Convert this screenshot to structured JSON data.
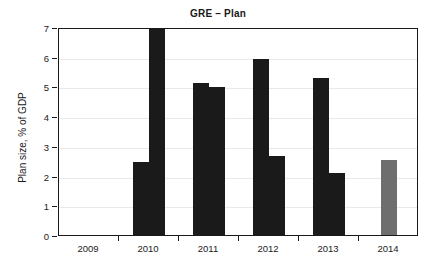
{
  "chart_data": {
    "type": "bar",
    "title": "GRE – Plan",
    "xlabel": "",
    "ylabel": "Plan size, % of GDP",
    "categories": [
      "2009",
      "2010",
      "2011",
      "2012",
      "2013",
      "2014"
    ],
    "ylim": [
      0,
      7
    ],
    "ytick_labels": [
      "0",
      "1",
      "2",
      "3",
      "4",
      "5",
      "6",
      "7"
    ],
    "ytick_values": [
      0,
      1,
      2,
      3,
      4,
      5,
      6,
      7
    ],
    "grid": true,
    "legend": "none",
    "series": [
      {
        "name": "first",
        "color": "#1a1a1a",
        "values": [
          null,
          2.45,
          5.1,
          5.93,
          5.3,
          null
        ]
      },
      {
        "name": "second",
        "color": "#1a1a1a",
        "values": [
          null,
          7.6,
          4.98,
          2.65,
          2.1,
          null
        ]
      },
      {
        "name": "projected",
        "color": "#6e6e6e",
        "values": [
          null,
          null,
          null,
          null,
          null,
          2.53
        ]
      }
    ],
    "bars": [
      {
        "category": "2010",
        "slot": 0,
        "value": 2.45,
        "color": "#1a1a1a",
        "clipped": false
      },
      {
        "category": "2010",
        "slot": 1,
        "value": 7.6,
        "color": "#1a1a1a",
        "clipped": true
      },
      {
        "category": "2011",
        "slot": 0,
        "value": 5.1,
        "color": "#1a1a1a",
        "clipped": false
      },
      {
        "category": "2011",
        "slot": 1,
        "value": 4.98,
        "color": "#1a1a1a",
        "clipped": false
      },
      {
        "category": "2012",
        "slot": 0,
        "value": 5.93,
        "color": "#1a1a1a",
        "clipped": false
      },
      {
        "category": "2012",
        "slot": 1,
        "value": 2.65,
        "color": "#1a1a1a",
        "clipped": false
      },
      {
        "category": "2013",
        "slot": 0,
        "value": 5.3,
        "color": "#1a1a1a",
        "clipped": false
      },
      {
        "category": "2013",
        "slot": 1,
        "value": 2.1,
        "color": "#1a1a1a",
        "clipped": false
      },
      {
        "category": "2014",
        "slot": 0,
        "value": 2.53,
        "color": "#6e6e6e",
        "clipped": false
      }
    ]
  },
  "colors": {
    "bar_dark": "#1a1a1a",
    "bar_gray": "#6e6e6e",
    "axis": "#1a1a1a",
    "grid": "#e9e9e9",
    "background": "#ffffff"
  }
}
